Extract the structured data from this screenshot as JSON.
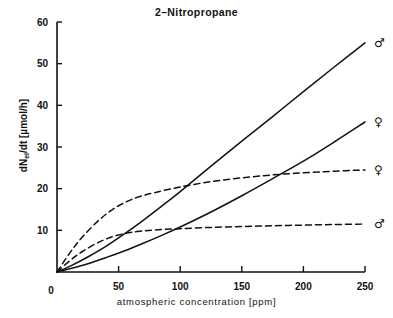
{
  "chart_data": {
    "type": "line",
    "xlabel": "atmospheric concentration  [ppm]",
    "ylabel": "dN_el/dt [µmol/h]",
    "ylabel_main": "dN",
    "ylabel_sub": "el",
    "ylabel_rest": "/dt [µmol/h]",
    "xlim": [
      0,
      250
    ],
    "ylim": [
      0,
      60
    ],
    "xticks": [
      0,
      50,
      100,
      150,
      200,
      250
    ],
    "yticks": [
      0,
      10,
      20,
      30,
      40,
      50,
      60
    ],
    "xtick_labels": [
      "0",
      "50",
      "100",
      "150",
      "200",
      "250"
    ],
    "ytick_labels": [
      "0",
      "10",
      "20",
      "30",
      "40",
      "50",
      "60"
    ],
    "grid": false,
    "legend_position": "right-endpoint-symbols",
    "series": [
      {
        "name": "male-solid",
        "symbol": "♂",
        "style": "solid",
        "endpoint_value": 55,
        "x": [
          0,
          12,
          25,
          40,
          55,
          70,
          85,
          100,
          125,
          150,
          175,
          200,
          225,
          250
        ],
        "values": [
          0,
          1.6,
          3.6,
          6.2,
          9.2,
          12.4,
          15.8,
          19.3,
          25.4,
          31.4,
          37.3,
          43.3,
          49.2,
          55.0
        ]
      },
      {
        "name": "female-solid",
        "symbol": "♀",
        "style": "solid",
        "endpoint_value": 36,
        "x": [
          0,
          12,
          25,
          40,
          55,
          70,
          85,
          100,
          125,
          150,
          175,
          200,
          225,
          250
        ],
        "values": [
          0,
          0.9,
          2.0,
          3.5,
          5.1,
          6.9,
          8.8,
          10.8,
          14.4,
          18.3,
          22.4,
          26.6,
          31.2,
          36.0
        ]
      },
      {
        "name": "female-dashed",
        "symbol": "♀",
        "style": "dashed",
        "endpoint_value": 24.5,
        "x": [
          0,
          10,
          20,
          35,
          50,
          65,
          80,
          100,
          125,
          150,
          175,
          200,
          225,
          250
        ],
        "values": [
          0,
          4.4,
          8.2,
          12.7,
          15.9,
          17.9,
          19.1,
          20.4,
          21.7,
          22.6,
          23.3,
          23.8,
          24.2,
          24.5
        ]
      },
      {
        "name": "male-dashed",
        "symbol": "♂",
        "style": "dashed",
        "endpoint_value": 11.5,
        "x": [
          0,
          10,
          20,
          35,
          50,
          65,
          80,
          100,
          125,
          150,
          175,
          200,
          225,
          250
        ],
        "values": [
          0,
          2.6,
          4.8,
          7.3,
          8.9,
          9.7,
          10.1,
          10.4,
          10.7,
          10.9,
          11.1,
          11.25,
          11.4,
          11.5
        ]
      }
    ]
  },
  "figure": {
    "title": "2–Nitropropane",
    "x_axis_title": "atmospheric  concentration   [ppm]",
    "y_axis_main": "dN",
    "y_axis_sub": "el",
    "y_axis_rest": "/dt  [µmol/h]",
    "axis_color": "#111111",
    "curve_color": "#111111"
  }
}
